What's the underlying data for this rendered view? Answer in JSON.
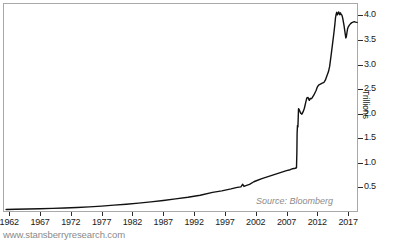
{
  "chart_data": {
    "type": "line",
    "title": "",
    "subtitle": "",
    "xlabel": "",
    "ylabel": "Trillions",
    "xlim": [
      1961.0,
      2018.6
    ],
    "ylim": [
      0.0,
      4.25
    ],
    "grid": false,
    "legend_position": "none",
    "x_tick_labels": [
      "1962",
      "1967",
      "1972",
      "1977",
      "1982",
      "1987",
      "1992",
      "1997",
      "2002",
      "2007",
      "2012",
      "2017"
    ],
    "x_tick_values": [
      1962,
      1967,
      1972,
      1977,
      1982,
      1987,
      1992,
      1997,
      2002,
      2007,
      2012,
      2017
    ],
    "y_tick_labels": [
      "0.5",
      "1.0",
      "1.5",
      "2.0",
      "2.5",
      "3.0",
      "3.5",
      "4.0"
    ],
    "y_tick_values": [
      0.5,
      1.0,
      1.5,
      2.0,
      2.5,
      3.0,
      3.5,
      4.0
    ],
    "y_axis_side": "right",
    "series": [
      {
        "name": "Total assets",
        "color": "#111111",
        "line_width": 1.4,
        "x": [
          1961.5,
          1963.0,
          1965.0,
          1967.0,
          1969.0,
          1971.0,
          1973.0,
          1975.0,
          1977.0,
          1979.0,
          1981.0,
          1983.0,
          1985.0,
          1987.0,
          1989.0,
          1991.0,
          1993.0,
          1995.0,
          1996.5,
          1998.0,
          1999.0,
          1999.6,
          1999.9,
          2000.1,
          2000.4,
          2001.0,
          2001.7,
          2002.0,
          2003.0,
          2004.0,
          2005.0,
          2006.0,
          2007.0,
          2007.6,
          2008.0,
          2008.4,
          2008.62,
          2008.68,
          2008.72,
          2008.78,
          2008.85,
          2008.95,
          2009.1,
          2009.3,
          2009.5,
          2009.7,
          2009.9,
          2010.1,
          2010.3,
          2010.5,
          2010.62,
          2010.7,
          2010.8,
          2010.9,
          2011.0,
          2011.15,
          2011.3,
          2011.45,
          2011.6,
          2011.8,
          2012.0,
          2012.2,
          2012.5,
          2012.8,
          2013.0,
          2013.1,
          2013.3,
          2013.5,
          2013.8,
          2014.0,
          2014.25,
          2014.5,
          2014.7,
          2014.85,
          2014.95,
          2015.05,
          2015.15,
          2015.25,
          2015.35,
          2015.45,
          2015.55,
          2015.65,
          2015.75,
          2015.85,
          2015.95,
          2016.05,
          2016.15,
          2016.25,
          2016.35,
          2016.45,
          2016.55,
          2016.62,
          2016.7,
          2016.8,
          2016.9,
          2017.0,
          2017.2,
          2017.4,
          2017.6,
          2017.8,
          2018.0,
          2018.2,
          2018.45
        ],
        "y": [
          0.052,
          0.055,
          0.06,
          0.066,
          0.073,
          0.082,
          0.092,
          0.105,
          0.12,
          0.14,
          0.158,
          0.18,
          0.205,
          0.235,
          0.268,
          0.3,
          0.34,
          0.4,
          0.43,
          0.47,
          0.5,
          0.51,
          0.565,
          0.52,
          0.535,
          0.56,
          0.615,
          0.63,
          0.68,
          0.72,
          0.76,
          0.8,
          0.84,
          0.86,
          0.88,
          0.89,
          0.9,
          1.2,
          1.6,
          1.76,
          1.73,
          2.1,
          2.07,
          2.01,
          1.99,
          2.04,
          2.11,
          2.22,
          2.32,
          2.33,
          2.29,
          2.27,
          2.3,
          2.31,
          2.3,
          2.32,
          2.35,
          2.38,
          2.42,
          2.47,
          2.54,
          2.58,
          2.6,
          2.62,
          2.63,
          2.64,
          2.68,
          2.75,
          2.85,
          2.96,
          3.2,
          3.45,
          3.65,
          3.82,
          3.95,
          4.02,
          4.06,
          4.01,
          4.03,
          4.07,
          4.04,
          4.01,
          4.05,
          4.02,
          4.01,
          3.98,
          3.92,
          3.85,
          3.78,
          3.69,
          3.6,
          3.54,
          3.56,
          3.64,
          3.72,
          3.76,
          3.8,
          3.83,
          3.85,
          3.86,
          3.87,
          3.86,
          3.855
        ]
      }
    ],
    "annotations": [
      {
        "name": "source-note",
        "text": "Source: Bloomberg",
        "style": "italic",
        "color": "#8c8c8c",
        "position": "bottom-right-inside"
      }
    ]
  },
  "axes": {
    "y_title": "Trillions",
    "y_ticks": [
      "0.5",
      "1.0",
      "1.5",
      "2.0",
      "2.5",
      "3.0",
      "3.5",
      "4.0"
    ],
    "x_ticks": [
      "1962",
      "1967",
      "1972",
      "1977",
      "1982",
      "1987",
      "1992",
      "1997",
      "2002",
      "2007",
      "2012",
      "2017"
    ]
  },
  "notes": {
    "source": "Source: Bloomberg",
    "watermark": "www.stansberryresearch.com"
  },
  "colors": {
    "line": "#111111",
    "frame": "#a9a9a9",
    "tick": "#2b2b2b",
    "axis_text": "#1a1a1a",
    "muted_text": "#8c8c8c",
    "watermark_text": "#8a8a8a",
    "background": "#ffffff"
  }
}
